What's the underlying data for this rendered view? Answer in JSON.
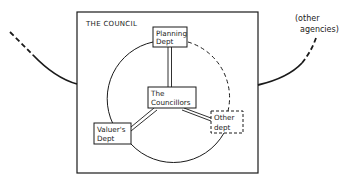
{
  "diagram": {
    "council_label": "THE COUNCIL",
    "nodes": {
      "planning": {
        "line1": "Planning",
        "line2": "Dept"
      },
      "councillors": {
        "line1": "The",
        "line2": "Councillors"
      },
      "valuers": {
        "line1": "Valuer's",
        "line2": "Dept"
      },
      "other_dept": {
        "line1": "Other",
        "line2": "dept",
        "style": "dashed"
      }
    },
    "external": {
      "line1": "(other",
      "line2": "agencies)"
    },
    "connections": [
      {
        "from": "councillors",
        "to": "planning",
        "style": "double-line"
      },
      {
        "from": "councillors",
        "to": "valuers",
        "style": "double-line"
      },
      {
        "from": "councillors",
        "to": "other_dept",
        "style": "double-line"
      },
      {
        "from": "planning",
        "to": "valuers",
        "style": "solid-arc"
      },
      {
        "from": "valuers",
        "to": "other_dept",
        "style": "solid-arc"
      },
      {
        "from": "planning",
        "to": "other_dept",
        "style": "dashed-arc"
      }
    ],
    "colors": {
      "ink": "#1a1a1a",
      "background": "#ffffff"
    }
  }
}
